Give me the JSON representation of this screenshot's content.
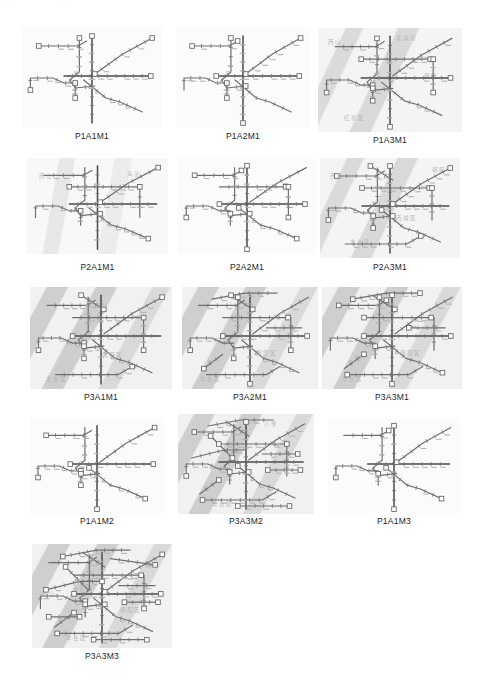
{
  "page": {
    "artifact_left": "···",
    "artifact_mid": "· ··"
  },
  "figure": {
    "name": "metro-network-scenario-grid",
    "panel_count": 13,
    "rows": [
      {
        "row_index": 1,
        "panels": [
          {
            "id": "p1a1m1",
            "label": "P1A1M1",
            "bg": "bg-light",
            "x": 22,
            "y": 28,
            "w": 140,
            "h": 100,
            "cap_y": 131,
            "ghosts": []
          },
          {
            "id": "p1a2m1",
            "label": "P1A2M1",
            "bg": "bg-light",
            "x": 176,
            "y": 28,
            "w": 134,
            "h": 100,
            "cap_y": 131,
            "ghosts": []
          },
          {
            "id": "p1a3m1",
            "label": "P1A3M1",
            "bg": "bg-gray",
            "x": 318,
            "y": 28,
            "w": 144,
            "h": 104,
            "cap_y": 135,
            "ghosts": [
              {
                "text": "西山",
                "x": 10,
                "y": 10
              },
              {
                "text": "北清河",
                "x": 78,
                "y": 6
              },
              {
                "text": "红星区",
                "x": 26,
                "y": 86
              },
              {
                "text": "朝阳",
                "x": 106,
                "y": 44
              }
            ]
          }
        ]
      },
      {
        "row_index": 2,
        "panels": [
          {
            "id": "p2a1m1",
            "label": "P2A1M1",
            "bg": "bg-vsoft",
            "x": 27,
            "y": 158,
            "w": 141,
            "h": 96,
            "cap_y": 262,
            "ghosts": [
              {
                "text": "西山",
                "x": 12,
                "y": 14
              },
              {
                "text": "海淀",
                "x": 100,
                "y": 12
              }
            ]
          },
          {
            "id": "p2a2m1",
            "label": "P2A2M1",
            "bg": "bg-light",
            "x": 178,
            "y": 158,
            "w": 138,
            "h": 96,
            "cap_y": 262,
            "ghosts": []
          },
          {
            "id": "p2a3m1",
            "label": "P2A3M1",
            "bg": "bg-gray",
            "x": 320,
            "y": 158,
            "w": 140,
            "h": 100,
            "cap_y": 262,
            "ghosts": [
              {
                "text": "西山",
                "x": 10,
                "y": 14
              },
              {
                "text": "朝阳",
                "x": 112,
                "y": 8
              },
              {
                "text": "西城区",
                "x": 76,
                "y": 56
              },
              {
                "text": "丰台区",
                "x": 30,
                "y": 80
              }
            ]
          }
        ]
      },
      {
        "row_index": 3,
        "panels": [
          {
            "id": "p3a1m1",
            "label": "P3A1M1",
            "bg": "bg-gray2",
            "x": 30,
            "y": 287,
            "w": 142,
            "h": 102,
            "cap_y": 392,
            "ghosts": [
              {
                "text": "朝阳区",
                "x": 72,
                "y": 64
              },
              {
                "text": "丰台区",
                "x": 16,
                "y": 88
              }
            ]
          },
          {
            "id": "p3a2m1",
            "label": "P3A2M1",
            "bg": "bg-gray2",
            "x": 182,
            "y": 287,
            "w": 136,
            "h": 102,
            "cap_y": 392,
            "ghosts": [
              {
                "text": "朝阳区",
                "x": 74,
                "y": 62
              },
              {
                "text": "丰台区",
                "x": 18,
                "y": 88
              }
            ]
          },
          {
            "id": "p3a3m1",
            "label": "P3A3M1",
            "bg": "bg-gray2",
            "x": 322,
            "y": 287,
            "w": 140,
            "h": 102,
            "cap_y": 392,
            "ghosts": [
              {
                "text": "朝阳区",
                "x": 78,
                "y": 62
              },
              {
                "text": "丰台区",
                "x": 20,
                "y": 88
              }
            ]
          }
        ]
      },
      {
        "row_index": 4,
        "panels": [
          {
            "id": "p1a1m2",
            "label": "P1A1M2",
            "bg": "bg-light",
            "x": 30,
            "y": 418,
            "w": 134,
            "h": 96,
            "cap_y": 516,
            "ghosts": []
          },
          {
            "id": "p3a3m2",
            "label": "P3A3M2",
            "bg": "bg-gray2",
            "x": 178,
            "y": 414,
            "w": 136,
            "h": 100,
            "cap_y": 516,
            "ghosts": [
              {
                "text": "八季",
                "x": 86,
                "y": 6
              },
              {
                "text": "丰台区",
                "x": 34,
                "y": 86
              }
            ]
          },
          {
            "id": "p1a1m3",
            "label": "P1A1M3",
            "bg": "bg-light",
            "x": 328,
            "y": 418,
            "w": 132,
            "h": 96,
            "cap_y": 516,
            "ghosts": []
          }
        ]
      },
      {
        "row_index": 5,
        "panels": [
          {
            "id": "p3a3m3",
            "label": "P3A3M3",
            "bg": "bg-gray2",
            "x": 32,
            "y": 544,
            "w": 140,
            "h": 104,
            "cap_y": 651,
            "ghosts": [
              {
                "text": "西山",
                "x": 10,
                "y": 46
              },
              {
                "text": "海淀区",
                "x": 40,
                "y": 40
              },
              {
                "text": "朝阳区",
                "x": 88,
                "y": 62
              },
              {
                "text": "丰台区",
                "x": 34,
                "y": 90
              }
            ]
          }
        ]
      }
    ]
  },
  "style": {
    "line_color": "#6f6f6f",
    "line_color_dark": "#4a4a4a",
    "station_color": "#7a7a7a",
    "terminal_fill": "#ffffff",
    "terminal_stroke": "#6a6a6a",
    "caption_color": "#1d1d1d"
  },
  "chart_data": {
    "type": "diagram-grid",
    "title": "",
    "scenario_codes": [
      "P1A1M1",
      "P1A2M1",
      "P1A3M1",
      "P2A1M1",
      "P2A2M1",
      "P2A3M1",
      "P3A1M1",
      "P3A2M1",
      "P3A3M1",
      "P1A1M2",
      "P3A3M2",
      "P1A1M3",
      "P3A3M3"
    ],
    "grid": {
      "columns": 3,
      "rows": 5,
      "last_row_columns": 1
    },
    "factors": {
      "P": {
        "name": "P",
        "levels": [
          1,
          2,
          3
        ]
      },
      "A": {
        "name": "A",
        "levels": [
          1,
          2,
          3
        ]
      },
      "M": {
        "name": "M",
        "levels": [
          1,
          2,
          3
        ]
      }
    },
    "complexity_by_code": {
      "P1A1M1": 1,
      "P1A2M1": 2,
      "P1A3M1": 3,
      "P2A1M1": 3,
      "P2A2M1": 4,
      "P2A3M1": 5,
      "P3A1M1": 6,
      "P3A2M1": 7,
      "P3A3M1": 8,
      "P1A1M2": 2,
      "P3A3M2": 9,
      "P1A1M3": 2,
      "P3A3M3": 10
    }
  }
}
